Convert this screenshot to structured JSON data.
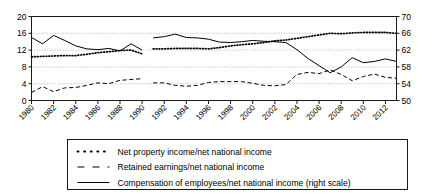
{
  "chart_data": {
    "type": "line",
    "title": "",
    "subtitle": "",
    "xlabel": "",
    "ylabel": "",
    "y2label": "",
    "grid": true,
    "legend_position": "bottom",
    "x": [
      1980,
      1981,
      1982,
      1983,
      1984,
      1985,
      1986,
      1987,
      1988,
      1989,
      1990,
      1991,
      1992,
      1993,
      1994,
      1995,
      1996,
      1997,
      1998,
      1999,
      2000,
      2001,
      2002,
      2003,
      2004,
      2005,
      2006,
      2007,
      2008,
      2009,
      2010,
      2011,
      2012,
      2013
    ],
    "xtick_labels": [
      "1980",
      "1982",
      "1984",
      "1986",
      "1988",
      "1990",
      "1992",
      "1994",
      "1996",
      "1998",
      "2000",
      "2002",
      "2004",
      "2006",
      "2008",
      "2010",
      "2012"
    ],
    "xticks": [
      1980,
      1982,
      1984,
      1986,
      1988,
      1990,
      1992,
      1994,
      1996,
      1998,
      2000,
      2002,
      2004,
      2006,
      2008,
      2010,
      2012
    ],
    "xlim": [
      1980,
      2013
    ],
    "ylim": [
      0,
      20
    ],
    "yticks": [
      0,
      4,
      8,
      12,
      16,
      20
    ],
    "ytick_labels": [
      "0",
      "4",
      "8",
      "12",
      "16",
      "20"
    ],
    "y2lim": [
      50,
      70
    ],
    "y2ticks": [
      50,
      54,
      58,
      62,
      66,
      70
    ],
    "y2tick_labels": [
      "50",
      "54",
      "58",
      "62",
      "66",
      "70"
    ],
    "data_break": {
      "after": 1990,
      "before": 1991
    },
    "series": [
      {
        "name": "Net property income/net national income",
        "axis": "left",
        "style": "dotted",
        "color": "#000000",
        "values": [
          10.4,
          10.5,
          10.6,
          10.7,
          10.7,
          11.0,
          11.4,
          11.6,
          11.9,
          12.0,
          11.1,
          12.3,
          12.3,
          12.4,
          12.4,
          12.4,
          12.3,
          12.6,
          13.0,
          13.3,
          13.5,
          13.8,
          14.2,
          14.4,
          14.8,
          15.2,
          15.6,
          16.0,
          15.9,
          16.1,
          16.2,
          16.2,
          16.2,
          16.0
        ]
      },
      {
        "name": "Retained earnings/net national income",
        "axis": "left",
        "style": "dashed",
        "color": "#000000",
        "values": [
          1.9,
          3.3,
          2.1,
          3.0,
          3.1,
          3.6,
          4.2,
          4.0,
          4.8,
          5.0,
          5.2,
          4.2,
          4.2,
          3.6,
          3.4,
          3.6,
          4.3,
          4.5,
          4.5,
          4.5,
          4.1,
          3.6,
          3.5,
          3.8,
          6.2,
          6.7,
          6.4,
          7.3,
          6.2,
          4.7,
          5.7,
          6.3,
          5.5,
          5.3
        ]
      },
      {
        "name": "Compensation of employees/net national income (right scale)",
        "axis": "right",
        "style": "solid",
        "color": "#000000",
        "values": [
          65.0,
          63.5,
          65.5,
          64.3,
          63.0,
          62.3,
          62.1,
          62.4,
          61.8,
          63.5,
          62.0,
          64.9,
          65.2,
          65.8,
          65.0,
          64.9,
          64.6,
          63.9,
          63.8,
          64.0,
          64.3,
          64.1,
          64.0,
          63.8,
          62.1,
          60.0,
          58.3,
          56.6,
          58.0,
          60.2,
          59.0,
          59.3,
          59.9,
          59.3
        ]
      }
    ],
    "legend": [
      {
        "label": "Net property income/net national income",
        "style": "dotted"
      },
      {
        "label": "Retained earnings/net national income",
        "style": "dashed"
      },
      {
        "label": "Compensation of employees/net national income (right scale)",
        "style": "solid"
      }
    ]
  }
}
